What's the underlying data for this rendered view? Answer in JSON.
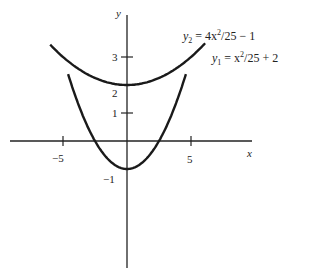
{
  "chart_data": {
    "type": "line",
    "title": "",
    "xlabel": "x",
    "ylabel": "y",
    "x_ticks": [
      -5,
      5
    ],
    "x_tick_labels": [
      "−5",
      "5"
    ],
    "y_ticks": [
      -1,
      1,
      2,
      3
    ],
    "y_tick_labels": [
      "−1",
      "1",
      "2",
      "3"
    ],
    "xlim": [
      -9,
      10
    ],
    "ylim": [
      -4.5,
      4.5
    ],
    "grid": false,
    "series": [
      {
        "name": "y2 = 4x^2/25 - 1",
        "equation": "y2 = 4x^2/25 − 1",
        "x": [
          -4.55,
          -4,
          -3,
          -2.5,
          -2,
          -1,
          0,
          1,
          2,
          2.5,
          3,
          4,
          4.55
        ],
        "values": [
          2.31,
          1.56,
          0.44,
          0.0,
          -0.36,
          -0.84,
          -1.0,
          -0.84,
          -0.36,
          0.0,
          0.44,
          1.56,
          2.31
        ]
      },
      {
        "name": "y1 = x^2/25 + 2",
        "equation": "y1 = x^2/25 + 2",
        "x": [
          -6,
          -5,
          -4,
          -3,
          -2,
          -1,
          0,
          1,
          2,
          3,
          4,
          5,
          6
        ],
        "values": [
          3.44,
          3.0,
          2.64,
          2.36,
          2.16,
          2.04,
          2.0,
          2.04,
          2.16,
          2.36,
          2.64,
          3.0,
          3.44
        ]
      }
    ]
  },
  "labels": {
    "x_axis": "x",
    "y_axis": "y",
    "tick_neg5": "−5",
    "tick_5": "5",
    "tick_neg1": "−1",
    "tick_1": "1",
    "tick_2": "2",
    "tick_3": "3",
    "eq_y2_lhs": "y",
    "eq_y2_sub": "2",
    "eq_y2_mid": " = 4x",
    "eq_y2_sup": "2",
    "eq_y2_rhs": "/25 − 1",
    "eq_y1_lhs": "y",
    "eq_y1_sub": "1",
    "eq_y1_mid": " = x",
    "eq_y1_sup": "2",
    "eq_y1_rhs": "/25 + 2"
  }
}
